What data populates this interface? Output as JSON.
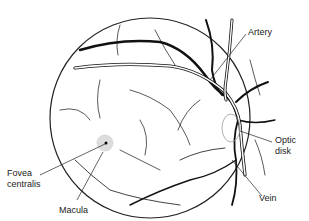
{
  "diagram": {
    "labels": {
      "artery": "Artery",
      "optic_disk_1": "Optic",
      "optic_disk_2": "disk",
      "vein": "Vein",
      "fovea_1": "Fovea",
      "fovea_2": "centralis",
      "macula": "Macula"
    }
  }
}
